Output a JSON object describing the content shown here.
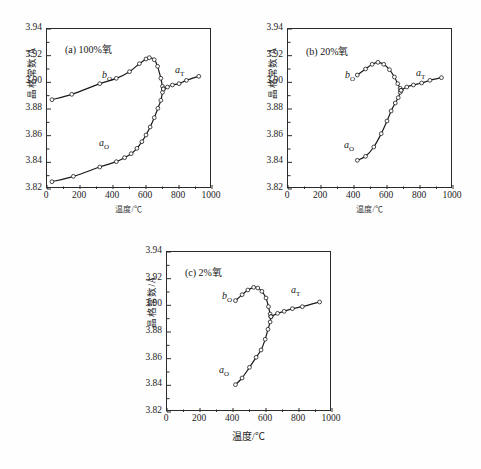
{
  "figure": {
    "background": "#fefefe",
    "line_color": "#1a1a1a",
    "marker_color": "#ffffff",
    "marker_edge": "#1a1a1a"
  },
  "axis": {
    "xlabel": "温度/℃",
    "ylabel": "晶格常数/Å",
    "xticks": [
      "0",
      "200",
      "400",
      "600",
      "800",
      "1000"
    ],
    "yticks": [
      "3.82",
      "3.84",
      "3.86",
      "3.88",
      "3.90",
      "3.92",
      "3.94"
    ],
    "xlim": [
      0,
      1000
    ],
    "ylim": [
      3.82,
      3.94
    ]
  },
  "labels": {
    "b_o": "b",
    "b_o_sub": "O",
    "a_o": "a",
    "a_o_sub": "O",
    "a_t": "a",
    "a_t_sub": "T"
  },
  "chart_data": [
    {
      "type": "line",
      "panel": "a",
      "title": "(a) 100%氧",
      "xlabel": "温度/℃",
      "ylabel": "晶格常数/Å",
      "xlim": [
        0,
        1000
      ],
      "ylim": [
        3.82,
        3.94
      ],
      "grid": false,
      "series": [
        {
          "name": "b_O",
          "label": "b_O",
          "x": [
            30,
            150,
            320,
            420,
            500,
            560,
            600,
            620,
            650,
            670,
            690,
            700,
            705
          ],
          "y": [
            3.887,
            3.891,
            3.899,
            3.903,
            3.908,
            3.914,
            3.9175,
            3.9185,
            3.917,
            3.912,
            3.903,
            3.897,
            3.895
          ]
        },
        {
          "name": "a_O",
          "label": "a_O",
          "x": [
            30,
            160,
            320,
            420,
            470,
            510,
            545,
            575,
            600,
            625,
            650,
            672,
            690,
            700,
            705
          ],
          "y": [
            3.8255,
            3.8295,
            3.8365,
            3.8405,
            3.8435,
            3.8465,
            3.8505,
            3.8555,
            3.8605,
            3.8665,
            3.8735,
            3.8805,
            3.8865,
            3.8925,
            3.895
          ]
        },
        {
          "name": "a_T",
          "label": "a_T",
          "x": [
            705,
            730,
            760,
            800,
            845,
            920
          ],
          "y": [
            3.895,
            3.8965,
            3.898,
            3.899,
            3.9015,
            3.9045
          ]
        }
      ]
    },
    {
      "type": "line",
      "panel": "b",
      "title": "(b) 20%氧",
      "xlabel": "温度/℃",
      "ylabel": "晶格常数/Å",
      "xlim": [
        0,
        1000
      ],
      "ylim": [
        3.82,
        3.94
      ],
      "grid": false,
      "series": [
        {
          "name": "b_O",
          "label": "b_O",
          "x": [
            420,
            470,
            510,
            545,
            580,
            615,
            645,
            665,
            680,
            685
          ],
          "y": [
            3.9055,
            3.91,
            3.9135,
            3.915,
            3.9135,
            3.9095,
            3.904,
            3.899,
            3.8955,
            3.894
          ]
        },
        {
          "name": "a_O",
          "label": "a_O",
          "x": [
            420,
            470,
            520,
            565,
            600,
            625,
            650,
            668,
            680,
            685
          ],
          "y": [
            3.8415,
            3.8445,
            3.8515,
            3.8615,
            3.871,
            3.8785,
            3.8845,
            3.8885,
            3.8925,
            3.894
          ]
        },
        {
          "name": "a_T",
          "label": "a_T",
          "x": [
            685,
            720,
            760,
            810,
            860,
            930
          ],
          "y": [
            3.894,
            3.8965,
            3.898,
            3.8995,
            3.9015,
            3.9035
          ]
        }
      ]
    },
    {
      "type": "line",
      "panel": "c",
      "title": "(c) 2%氧",
      "xlabel": "温度/℃",
      "ylabel": "晶格常数/Å",
      "xlim": [
        0,
        1000
      ],
      "ylim": [
        3.82,
        3.94
      ],
      "grid": false,
      "series": [
        {
          "name": "b_O",
          "label": "b_O",
          "x": [
            415,
            455,
            490,
            525,
            550,
            575,
            600,
            615,
            625,
            630
          ],
          "y": [
            3.9035,
            3.908,
            3.9115,
            3.9135,
            3.913,
            3.9105,
            3.9055,
            3.899,
            3.8935,
            3.8915
          ]
        },
        {
          "name": "a_O",
          "label": "a_O",
          "x": [
            415,
            455,
            500,
            540,
            570,
            595,
            612,
            625,
            630
          ],
          "y": [
            3.8405,
            3.8455,
            3.8535,
            3.861,
            3.8665,
            3.8745,
            3.882,
            3.8875,
            3.8915
          ]
        },
        {
          "name": "a_T",
          "label": "a_T",
          "x": [
            630,
            670,
            710,
            760,
            820,
            925
          ],
          "y": [
            3.8915,
            3.894,
            3.8955,
            3.8975,
            3.899,
            3.9025
          ]
        }
      ]
    }
  ]
}
